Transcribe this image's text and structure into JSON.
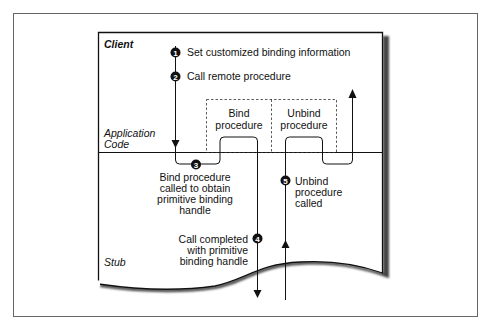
{
  "figure": {
    "region_labels": {
      "client": "Client",
      "application_code_line1": "Application",
      "application_code_line2": "Code",
      "stub": "Stub"
    },
    "procedure_boxes": {
      "bind": [
        "Bind",
        "procedure"
      ],
      "unbind": [
        "Unbind",
        "procedure"
      ]
    },
    "steps": [
      {
        "number": "1",
        "lines": [
          "Set customized binding information"
        ]
      },
      {
        "number": "2",
        "lines": [
          "Call remote procedure"
        ]
      },
      {
        "number": "3",
        "lines": [
          "Bind procedure",
          "called to obtain",
          "primitive binding",
          "handle"
        ]
      },
      {
        "number": "4",
        "lines": [
          "Call completed",
          "with primitive",
          "binding handle"
        ]
      },
      {
        "number": "5",
        "lines": [
          "Unbind",
          "procedure",
          "called"
        ]
      }
    ],
    "colors": {
      "line": "#111111",
      "frame": "#555555",
      "shadow": "#444444",
      "dashed": "#333333",
      "background": "#ffffff"
    }
  }
}
